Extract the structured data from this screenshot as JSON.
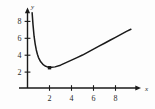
{
  "chart_data": {
    "type": "line",
    "title": "",
    "subtitle": "",
    "xlabel": "x",
    "ylabel": "y",
    "xlim": [
      0,
      10
    ],
    "ylim": [
      0,
      9
    ],
    "grid": false,
    "legend": null,
    "x_ticks": [
      2,
      4,
      6,
      8
    ],
    "y_ticks": [
      2,
      4,
      6,
      8
    ],
    "x_tick_labels": [
      "2",
      "4",
      "6",
      "8"
    ],
    "y_tick_labels": [
      "2",
      "4",
      "6",
      "8"
    ],
    "axis_arrows": {
      "x": true,
      "y": true
    },
    "series": [
      {
        "name": "curve",
        "color": "#1a1a1a",
        "x": [
          0.42,
          0.5,
          0.6,
          0.7,
          0.8,
          0.9,
          1.0,
          1.2,
          1.4,
          1.6,
          1.8,
          2.0,
          2.2,
          2.5,
          3.0,
          3.5,
          4.0,
          4.5,
          5.0,
          5.5,
          6.0,
          6.5,
          7.0,
          7.5,
          8.0,
          8.5,
          9.0,
          9.4
        ],
        "y": [
          8.9,
          7.5,
          6.1,
          5.2,
          4.5,
          4.0,
          3.6,
          3.1,
          2.8,
          2.6,
          2.5,
          2.4,
          2.45,
          2.5,
          2.7,
          3.0,
          3.3,
          3.6,
          3.9,
          4.25,
          4.6,
          4.95,
          5.3,
          5.65,
          6.0,
          6.35,
          6.7,
          6.95
        ]
      }
    ],
    "annotations": [
      {
        "name": "minimum-point",
        "kind": "point-marker",
        "x": 2.0,
        "y": 2.4,
        "label": "",
        "color": "#1a1a1a"
      }
    ]
  },
  "axes": {
    "x_axis_label": "x",
    "y_axis_label": "y"
  }
}
